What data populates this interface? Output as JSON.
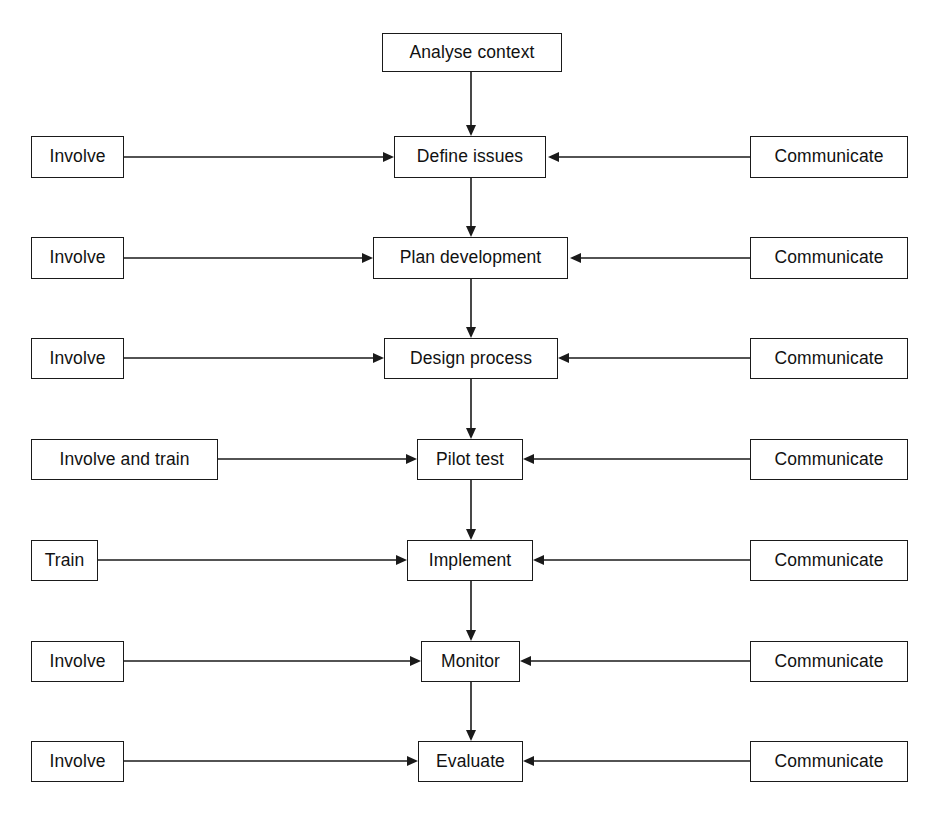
{
  "diagram": {
    "type": "flowchart",
    "background_color": "#ffffff",
    "line_color": "#1a1a1a",
    "box_fill_color": "#ffffff",
    "rows": [
      {
        "row_index": 0,
        "left": null,
        "center": "Analyse context",
        "right": null
      },
      {
        "row_index": 1,
        "left": "Involve",
        "center": "Define issues",
        "right": "Communicate"
      },
      {
        "row_index": 2,
        "left": "Involve",
        "center": "Plan development",
        "right": "Communicate"
      },
      {
        "row_index": 3,
        "left": "Involve",
        "center": "Design process",
        "right": "Communicate"
      },
      {
        "row_index": 4,
        "left": "Involve and train",
        "center": "Pilot test",
        "right": "Communicate"
      },
      {
        "row_index": 5,
        "left": "Train",
        "center": "Implement",
        "right": "Communicate"
      },
      {
        "row_index": 6,
        "left": "Involve",
        "center": "Monitor",
        "right": "Communicate"
      },
      {
        "row_index": 7,
        "left": "Involve",
        "center": "Evaluate",
        "right": "Communicate"
      }
    ],
    "center_nodes": [
      "Analyse context",
      "Define issues",
      "Plan development",
      "Design process",
      "Pilot test",
      "Implement",
      "Monitor",
      "Evaluate"
    ],
    "left_nodes": [
      "Involve",
      "Involve",
      "Involve",
      "Involve and train",
      "Train",
      "Involve",
      "Involve"
    ],
    "right_nodes": [
      "Communicate",
      "Communicate",
      "Communicate",
      "Communicate",
      "Communicate",
      "Communicate",
      "Communicate"
    ],
    "vertical_flow": [
      "Analyse context -> Define issues",
      "Define issues -> Plan development",
      "Plan development -> Design process",
      "Design process -> Pilot test",
      "Pilot test -> Implement",
      "Implement -> Monitor",
      "Monitor -> Evaluate"
    ]
  }
}
